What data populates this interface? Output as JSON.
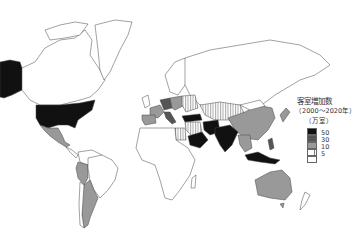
{
  "legend": {
    "title": "客室増加数",
    "period": "（2000～2020年）",
    "unit": "（万室）",
    "classes": [
      {
        "label": "50",
        "color": "#111111",
        "pattern": "solid"
      },
      {
        "label": "30",
        "color": "#555555",
        "pattern": "solid"
      },
      {
        "label": "10",
        "color": "#999999",
        "pattern": "solid"
      },
      {
        "label": "5",
        "color": "#ffffff",
        "pattern": "vertical-stripes"
      },
      {
        "label": "",
        "color": "#ffffff",
        "pattern": "blank"
      }
    ]
  },
  "map": {
    "regions": [
      {
        "name": "USA",
        "class": "50"
      },
      {
        "name": "Alaska",
        "class": "50"
      },
      {
        "name": "Canada",
        "class": "blank"
      },
      {
        "name": "Greenland",
        "class": "blank"
      },
      {
        "name": "Mexico",
        "class": "10"
      },
      {
        "name": "Peru",
        "class": "10"
      },
      {
        "name": "Argentina",
        "class": "10"
      },
      {
        "name": "Brazil",
        "class": "blank"
      },
      {
        "name": "Europe (Germany, France, Italy)",
        "class": "10-30"
      },
      {
        "name": "Spain",
        "class": "10"
      },
      {
        "name": "Turkey",
        "class": "50"
      },
      {
        "name": "Saudi Arabia",
        "class": "50"
      },
      {
        "name": "Iran",
        "class": "50"
      },
      {
        "name": "India",
        "class": "50"
      },
      {
        "name": "China",
        "class": "30"
      },
      {
        "name": "Kazakhstan / Central Asia",
        "class": "5"
      },
      {
        "name": "Egypt",
        "class": "5"
      },
      {
        "name": "Indonesia",
        "class": "50"
      },
      {
        "name": "Australia",
        "class": "10"
      },
      {
        "name": "Africa",
        "class": "blank"
      },
      {
        "name": "Russia",
        "class": "blank"
      },
      {
        "name": "New Zealand",
        "class": "blank"
      }
    ]
  }
}
